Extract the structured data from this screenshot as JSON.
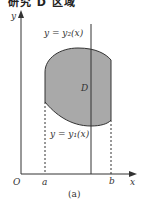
{
  "figure": {
    "top_text_partial": "研究 D 区域",
    "caption": "(a)",
    "axes": {
      "y_label": "y",
      "x_label": "x",
      "origin_label": "O",
      "x_ticks": [
        "a",
        "b"
      ]
    },
    "curves": {
      "upper_label": "y = y₂(x)",
      "lower_label": "y = y₁(x)"
    },
    "region_label": "D",
    "colors": {
      "region_fill": "#a9a9a9",
      "stroke": "#333333",
      "background": "#ffffff"
    }
  }
}
